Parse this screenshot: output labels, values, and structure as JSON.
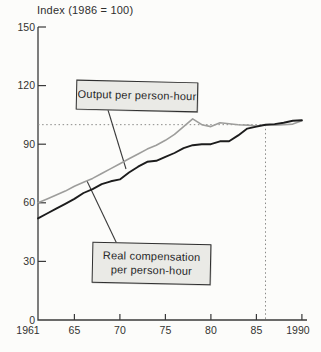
{
  "figure": {
    "axis_title": "Index (1986 = 100)"
  },
  "annotations": {
    "output_box": "Output per person-hour",
    "compensation_box_line1": "Real compensation",
    "compensation_box_line2": "per person-hour"
  },
  "colors": {
    "output_line": "#1c1c1c",
    "compensation_line": "#9d9d9b",
    "box_fill": "#eaeae6",
    "box_border": "#2f2f2f",
    "axis": "#3a3a3a",
    "dotted_reference": "#8a8a88",
    "text": "#2e2e2e",
    "background": "#fcfcfa"
  },
  "chart_data": {
    "type": "line",
    "title": "Index (1986 = 100)",
    "xlabel": "",
    "ylabel": "Index (1986 = 100)",
    "x": [
      1961,
      1962,
      1963,
      1964,
      1965,
      1966,
      1967,
      1968,
      1969,
      1970,
      1971,
      1972,
      1973,
      1974,
      1975,
      1976,
      1977,
      1978,
      1979,
      1980,
      1981,
      1982,
      1983,
      1984,
      1985,
      1986,
      1987,
      1988,
      1989,
      1990
    ],
    "series": [
      {
        "name": "Output per person-hour",
        "color": "#1c1c1c",
        "values": [
          52,
          54.5,
          57,
          59.5,
          62,
          65,
          67,
          69.5,
          71,
          72,
          75.5,
          78.5,
          81,
          81.5,
          83.5,
          85.5,
          88,
          89.5,
          90,
          90,
          91.5,
          91.5,
          94.5,
          98,
          99,
          100,
          100.3,
          101,
          102,
          102.3
        ]
      },
      {
        "name": "Real compensation per person-hour",
        "color": "#9d9d9b",
        "values": [
          60,
          62,
          64,
          66,
          68.5,
          70.5,
          72.5,
          75,
          77.5,
          80,
          82.5,
          85,
          87.5,
          89.5,
          92,
          95,
          99,
          103,
          100,
          99,
          101,
          100.5,
          100,
          99.8,
          99.3,
          100,
          99.8,
          100,
          100.3,
          102
        ]
      }
    ],
    "xlim": [
      1961,
      1990
    ],
    "ylim": [
      0,
      150
    ],
    "yticks": {
      "values": [
        0,
        30,
        60,
        90,
        120,
        150
      ],
      "labels": [
        "0",
        "30",
        "60",
        "90",
        "120",
        "150"
      ]
    },
    "xticks": {
      "values": [
        1961,
        1965,
        1970,
        1975,
        1980,
        1985,
        1990
      ],
      "labels": [
        "1961",
        "65",
        "70",
        "75",
        "80",
        "85",
        "1990"
      ]
    },
    "grid": false,
    "legend_position": "annotation-boxes",
    "reference_lines": {
      "horizontal_at": 100,
      "vertical_at": 1986,
      "style": "dotted"
    }
  }
}
